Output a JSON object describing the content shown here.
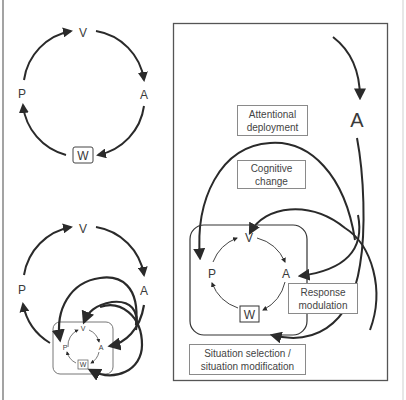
{
  "diagram": {
    "top_left_cycle": {
      "nodes": [
        {
          "id": "V",
          "label": "V"
        },
        {
          "id": "A",
          "label": "A"
        },
        {
          "id": "W",
          "label": "W",
          "boxed": true
        },
        {
          "id": "P",
          "label": "P"
        }
      ],
      "edges": [
        [
          "P",
          "V"
        ],
        [
          "V",
          "A"
        ],
        [
          "A",
          "W"
        ],
        [
          "W",
          "P"
        ]
      ]
    },
    "bottom_left_cycle": {
      "outer_nodes": [
        {
          "id": "V",
          "label": "V"
        },
        {
          "id": "A",
          "label": "A"
        },
        {
          "id": "P",
          "label": "P"
        }
      ],
      "inner_nodes": [
        {
          "id": "V",
          "label": "V"
        },
        {
          "id": "A",
          "label": "A"
        },
        {
          "id": "W",
          "label": "W",
          "boxed": true
        },
        {
          "id": "P",
          "label": "P"
        }
      ]
    },
    "right_panel": {
      "top_node": {
        "id": "A",
        "label": "A"
      },
      "inner_nodes": [
        {
          "id": "V",
          "label": "V"
        },
        {
          "id": "A",
          "label": "A"
        },
        {
          "id": "W",
          "label": "W",
          "boxed": true
        },
        {
          "id": "P",
          "label": "P"
        }
      ],
      "strategy_labels": [
        {
          "id": "attentional",
          "line1": "Attentional",
          "line2": "deployment"
        },
        {
          "id": "cognitive",
          "line1": "Cognitive",
          "line2": "change"
        },
        {
          "id": "response",
          "line1": "Response",
          "line2": "modulation"
        },
        {
          "id": "situation",
          "line1": "Situation selection /",
          "line2": "situation modification"
        }
      ]
    },
    "colors": {
      "stroke": "#2a2a2a",
      "frame": "#555555",
      "label_box_border": "#8a8a8a",
      "text": "#3a3a3a"
    }
  }
}
